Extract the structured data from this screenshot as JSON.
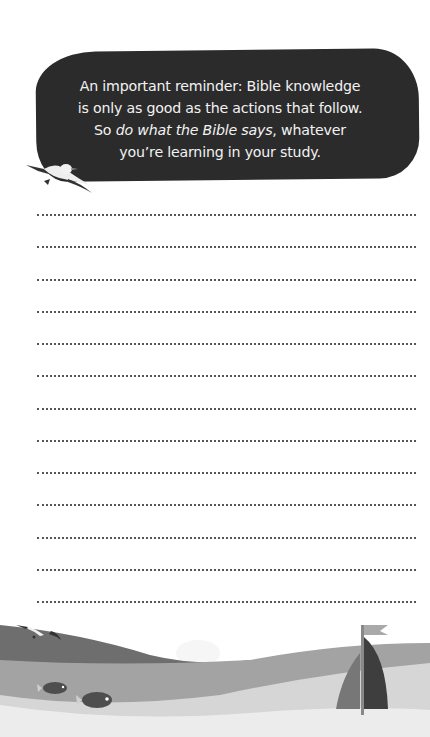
{
  "reminder": {
    "line1": "An important reminder: Bible knowledge",
    "line2": "is only as good as the actions that follow.",
    "line3_prefix": "So ",
    "line3_emphasis": "do what the Bible says",
    "line3_suffix": ", whatever",
    "line4": "you’re learning in your study."
  },
  "writing_lines": {
    "count": 13,
    "first_y": 214,
    "spacing": 32.25
  },
  "colors": {
    "bubble": "#2b2b2b",
    "bubble_text": "#f2f2f2",
    "wave_dark": "#6e6e6e",
    "wave_mid": "#a3a3a3",
    "wave_light": "#d6d6d6",
    "sea_floor": "#ececec",
    "sail_dark": "#3e3e3e",
    "sail_mid": "#777777"
  },
  "illustrations": {
    "top_gull": "seagull-icon",
    "sky_gull": "seagull-icon",
    "boat": "sailboat-icon",
    "fish": [
      "fish-icon",
      "fish-icon"
    ],
    "cloud": "cloud-icon"
  }
}
